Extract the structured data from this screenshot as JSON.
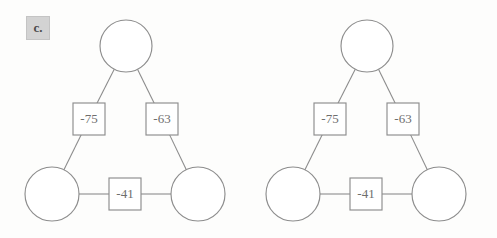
{
  "panel": {
    "label": "c."
  },
  "figure": {
    "type": "graph-diagram-pair",
    "background_color": "#fdfdfc",
    "stroke_color": "#8d8d8d",
    "node_fill_color": "#ffffff",
    "label_text_color": "#6e6e6e",
    "badge_background_color": "#d3d3d3"
  },
  "diagrams": [
    {
      "id": "left",
      "name": "graph-diagram-left",
      "nodes": [
        {
          "id": "top",
          "label": "",
          "cx": 126,
          "cy": 46,
          "r": 26
        },
        {
          "id": "bottom-left",
          "label": "",
          "cx": 52,
          "cy": 194,
          "r": 27
        },
        {
          "id": "bottom-right",
          "label": "",
          "cx": 198,
          "cy": 194,
          "r": 27
        }
      ],
      "edges": [
        {
          "id": "top-bottomleft",
          "value": "-75",
          "bx": 89,
          "by": 119,
          "w": 32,
          "h": 32
        },
        {
          "id": "top-bottomright",
          "value": "-63",
          "bx": 162,
          "by": 119,
          "w": 32,
          "h": 32
        },
        {
          "id": "bottomleft-bottomright",
          "value": "-41",
          "bx": 125,
          "by": 194,
          "w": 32,
          "h": 32
        }
      ]
    },
    {
      "id": "right",
      "name": "graph-diagram-right",
      "nodes": [
        {
          "id": "top",
          "label": "",
          "cx": 124,
          "cy": 46,
          "r": 26
        },
        {
          "id": "bottom-left",
          "label": "",
          "cx": 50,
          "cy": 194,
          "r": 27
        },
        {
          "id": "bottom-right",
          "label": "",
          "cx": 196,
          "cy": 194,
          "r": 27
        }
      ],
      "edges": [
        {
          "id": "top-bottomleft",
          "value": "-75",
          "bx": 87,
          "by": 119,
          "w": 32,
          "h": 32
        },
        {
          "id": "top-bottomright",
          "value": "-63",
          "bx": 160,
          "by": 119,
          "w": 32,
          "h": 32
        },
        {
          "id": "bottomleft-bottomright",
          "value": "-41",
          "bx": 123,
          "by": 194,
          "w": 32,
          "h": 32
        }
      ]
    }
  ]
}
